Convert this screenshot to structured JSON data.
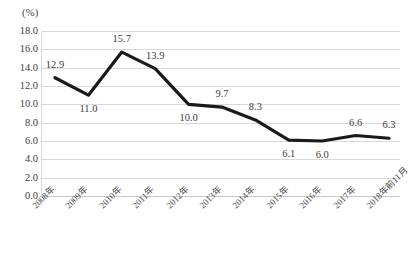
{
  "chart_data": {
    "type": "line",
    "title": "",
    "subtitle": "",
    "xlabel": "",
    "ylabel": "(%)",
    "unit_label": "(%)",
    "ylim": [
      0.0,
      18.0
    ],
    "ytick_step": 2.0,
    "grid": true,
    "legend": false,
    "legend_position": "none",
    "series_color": "#1a1a1a",
    "gridline_color": "#d9d9d9",
    "text_color": "#3d3d3d",
    "categories": [
      "2008年",
      "2009年",
      "2010年",
      "2011年",
      "2012年",
      "2013年",
      "2014年",
      "2015年",
      "2016年",
      "2017年",
      "2018年前11月"
    ],
    "values": [
      12.9,
      11.0,
      15.7,
      13.9,
      10.0,
      9.7,
      8.3,
      6.1,
      6.0,
      6.6,
      6.3
    ],
    "data_labels": [
      "12.9",
      "11.0",
      "15.7",
      "13.9",
      "10.0",
      "9.7",
      "8.3",
      "6.1",
      "6.0",
      "6.6",
      "6.3"
    ],
    "data_label_placement": [
      "above",
      "below",
      "above",
      "above",
      "below",
      "above",
      "above",
      "below",
      "below",
      "above",
      "above"
    ],
    "ytick_labels": [
      "18.0",
      "16.0",
      "14.0",
      "12.0",
      "10.0",
      "8.0",
      "6.0",
      "4.0",
      "2.0",
      "0.0"
    ],
    "ytick_values": [
      18.0,
      16.0,
      14.0,
      12.0,
      10.0,
      8.0,
      6.0,
      4.0,
      2.0,
      0.0
    ]
  }
}
